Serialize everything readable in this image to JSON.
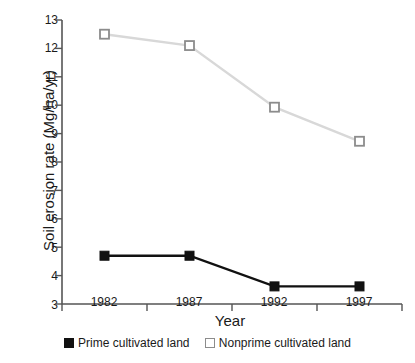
{
  "chart_data": {
    "type": "line",
    "title": "",
    "xlabel": "Year",
    "ylabel": "Soil erosion rate (Mg/ha/yr)",
    "categories": [
      "1982",
      "1987",
      "1992",
      "1997"
    ],
    "x": [
      1982,
      1987,
      1992,
      1997
    ],
    "ylim": [
      3,
      13
    ],
    "yticks": [
      3,
      4,
      5,
      6,
      7,
      8,
      9,
      10,
      11,
      12,
      13
    ],
    "ytick_labels": [
      "3",
      "4",
      "5",
      "6",
      "7",
      "8",
      "9",
      "10",
      "11",
      "12",
      "13"
    ],
    "grid": false,
    "legend_position": "bottom",
    "series": [
      {
        "name": "Prime cultivated land",
        "values": [
          4.7,
          4.7,
          3.62,
          3.62
        ],
        "color": "#111111",
        "marker": "filled-square"
      },
      {
        "name": "Nonprime cultivated land",
        "values": [
          12.5,
          12.1,
          9.93,
          8.73
        ],
        "color": "#d4d4d4",
        "marker": "open-square"
      }
    ]
  },
  "axes": {
    "axis_color": "#555555",
    "ylabel": "Soil erosion rate (Mg/ha/yr)",
    "xlabel": "Year",
    "ytick_labels": [
      "13",
      "12",
      "11",
      "10",
      "9",
      "8",
      "7",
      "6",
      "5",
      "4",
      "3"
    ],
    "xtick_labels": [
      "1982",
      "1987",
      "1992",
      "1997"
    ]
  },
  "legend": {
    "entries": [
      {
        "label": "Prime cultivated land",
        "marker": "filled-square"
      },
      {
        "label": "Nonprime cultivated land",
        "marker": "open-square"
      }
    ]
  }
}
